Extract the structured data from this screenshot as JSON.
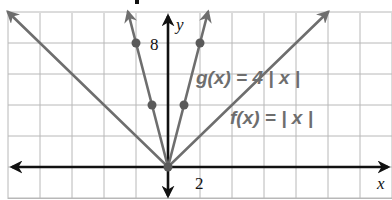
{
  "chart_data": {
    "type": "line",
    "title": "",
    "xlabel": "x",
    "ylabel": "y",
    "xlim": [
      -10,
      14
    ],
    "ylim": [
      -2,
      10
    ],
    "grid": true,
    "x_step": 2,
    "y_step": 2,
    "tick_labels": {
      "x": [
        {
          "value": 2,
          "label": "2"
        }
      ],
      "y": [
        {
          "value": 8,
          "label": "8"
        }
      ]
    },
    "series": [
      {
        "name": "f(x) = | x |",
        "equation": "f(x) = |x|",
        "color": "#6e6e6e",
        "points": [
          [
            -10,
            10
          ],
          [
            0,
            0
          ],
          [
            10,
            10
          ]
        ],
        "marked_points": []
      },
      {
        "name": "g(x) = 4 | x |",
        "equation": "g(x) = 4|x|",
        "color": "#6e6e6e",
        "points": [
          [
            -2.5,
            10
          ],
          [
            0,
            0
          ],
          [
            2.5,
            10
          ]
        ],
        "marked_points": [
          [
            -2,
            8
          ],
          [
            -1,
            4
          ],
          [
            0,
            0
          ],
          [
            1,
            4
          ],
          [
            2,
            8
          ]
        ]
      }
    ],
    "annotations": [
      {
        "text": "g(x) = 4 | x |",
        "x": 1.8,
        "y": 6
      },
      {
        "text": "f(x) = | x |",
        "x": 6,
        "y": 2.8
      }
    ]
  },
  "labels": {
    "x_axis": "x",
    "y_axis": "y",
    "x_tick_2": "2",
    "y_tick_8": "8",
    "g_label": "g(x) = 4 | x |",
    "f_label": "f(x) = | x |"
  },
  "colors": {
    "curve": "#6e6e6e",
    "axis": "#111111",
    "grid": "#b8b8b8"
  }
}
